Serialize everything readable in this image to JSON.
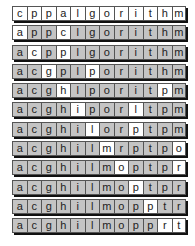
{
  "diagram": {
    "rows": [
      {
        "letters": [
          "c",
          "p",
          "p",
          "a",
          "l",
          "g",
          "o",
          "r",
          "i",
          "t",
          "h",
          "m"
        ],
        "highlight": [
          0,
          1,
          2,
          3,
          4,
          5,
          6,
          7,
          8,
          9,
          10,
          11
        ]
      },
      {
        "letters": [
          "a",
          "p",
          "p",
          "c",
          "l",
          "g",
          "o",
          "r",
          "i",
          "t",
          "h",
          "m"
        ],
        "highlight": [
          0,
          3
        ]
      },
      {
        "letters": [
          "a",
          "c",
          "p",
          "p",
          "l",
          "g",
          "o",
          "r",
          "i",
          "t",
          "h",
          "m"
        ],
        "highlight": [
          1,
          3
        ]
      },
      {
        "letters": [
          "a",
          "c",
          "g",
          "p",
          "l",
          "p",
          "o",
          "r",
          "i",
          "t",
          "h",
          "m"
        ],
        "highlight": [
          2,
          5
        ]
      },
      {
        "letters": [
          "a",
          "c",
          "g",
          "h",
          "l",
          "p",
          "o",
          "r",
          "i",
          "t",
          "p",
          "m"
        ],
        "highlight": [
          3,
          10
        ]
      },
      {
        "letters": [
          "a",
          "c",
          "g",
          "h",
          "i",
          "p",
          "o",
          "r",
          "l",
          "t",
          "p",
          "m"
        ],
        "highlight": [
          4,
          8
        ]
      },
      {
        "letters": [
          "a",
          "c",
          "g",
          "h",
          "i",
          "l",
          "o",
          "r",
          "p",
          "t",
          "p",
          "m"
        ],
        "highlight": [
          5,
          8
        ]
      },
      {
        "letters": [
          "a",
          "c",
          "g",
          "h",
          "i",
          "l",
          "m",
          "r",
          "p",
          "t",
          "p",
          "o"
        ],
        "highlight": [
          6,
          11
        ]
      },
      {
        "letters": [
          "a",
          "c",
          "g",
          "h",
          "i",
          "l",
          "m",
          "o",
          "p",
          "t",
          "p",
          "r"
        ],
        "highlight": [
          7,
          11
        ]
      },
      {
        "letters": [
          "a",
          "c",
          "g",
          "h",
          "i",
          "l",
          "m",
          "o",
          "p",
          "t",
          "p",
          "r"
        ],
        "highlight": [
          8
        ]
      },
      {
        "letters": [
          "a",
          "c",
          "g",
          "h",
          "i",
          "l",
          "m",
          "o",
          "p",
          "p",
          "t",
          "r"
        ],
        "highlight": [
          9
        ]
      },
      {
        "letters": [
          "a",
          "c",
          "g",
          "h",
          "i",
          "l",
          "m",
          "o",
          "p",
          "p",
          "r",
          "t"
        ],
        "highlight": [
          10,
          11
        ]
      }
    ],
    "colors": {
      "highlight": "#ffffff",
      "normal": "#c4c4c4",
      "shadow": "#111111"
    }
  }
}
